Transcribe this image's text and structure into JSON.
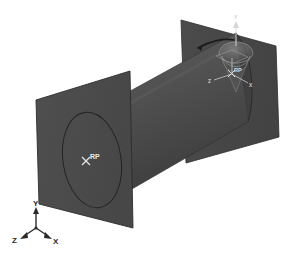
{
  "viewport": {
    "name": "abaqus-3d-viewport",
    "width": 294,
    "height": 253,
    "background_color": "#ffffff"
  },
  "colors": {
    "background": "#ffffff",
    "plane_fill": "#4a4a4a",
    "plane_fill_right": "#474747",
    "plane_edge": "#2e2e2e",
    "cylinder_light": "#5a5a5a",
    "cylinder_mid": "#4c4c4c",
    "cylinder_dark": "#3a3a3a",
    "circle_edge": "#262626",
    "rp_marker": "#e0e0e0",
    "rp_text": "#e8e8e8",
    "triad_color": "#2a2a2a",
    "manipulator_highlight": "#9a9a9a",
    "rotation_arc": "#1c1c1c"
  },
  "geometry": {
    "part_name": "cylinder",
    "description": "Shell cylinder between two rigid analytical planes",
    "left_plane": {
      "label": "left-rigid-plane",
      "points": "36,100 130,71 133,228 39,204"
    },
    "right_plane": {
      "label": "right-rigid-plane",
      "points": "181,20 276,46 279,137 186,163"
    },
    "cylinder_body": {
      "label": "cylinder-surface"
    },
    "left_circle": {
      "label": "left-end-circle",
      "cx": 92,
      "cy": 160,
      "rx": 29,
      "ry": 48,
      "rotation": -8
    }
  },
  "reference_points": [
    {
      "id": "rp-left",
      "label": "RP",
      "marker": "x-marker",
      "x": 86,
      "y": 161
    },
    {
      "id": "rp-right",
      "label": "RP",
      "marker": "x-marker",
      "x": 232,
      "y": 73
    }
  ],
  "manipulator": {
    "name": "rotation-manipulator-widget",
    "center_x": 236,
    "center_y": 73,
    "axes": [
      {
        "id": "manip-axis-y",
        "label": "Y"
      },
      {
        "id": "manip-axis-x",
        "label": "X"
      },
      {
        "id": "manip-axis-z",
        "label": "Z"
      }
    ],
    "rotation_arc": {
      "id": "rotation-arc",
      "label": "rotation-arrow"
    },
    "dome": {
      "id": "manip-dome",
      "label": "rotation-dome"
    }
  },
  "axis_triad": {
    "name": "orientation-triad",
    "origin_x": 36,
    "origin_y": 228,
    "axes": [
      {
        "id": "triad-axis-y",
        "label": "Y",
        "tip_x": 36,
        "tip_y": 208,
        "label_x": 33,
        "label_y": 204
      },
      {
        "id": "triad-axis-z",
        "label": "Z",
        "tip_x": 22,
        "tip_y": 238,
        "label_x": 15,
        "label_y": 243
      },
      {
        "id": "triad-axis-x",
        "label": "X",
        "tip_x": 51,
        "tip_y": 238,
        "label_x": 53,
        "label_y": 244
      }
    ]
  }
}
